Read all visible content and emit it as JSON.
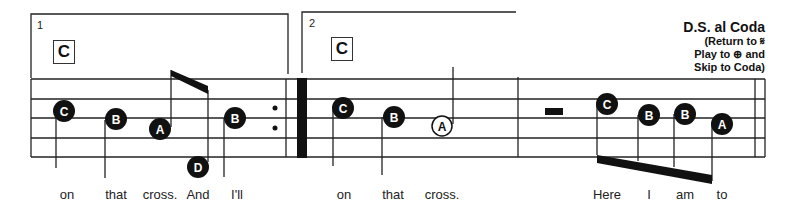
{
  "endings": [
    {
      "number": "1",
      "chord": "C"
    },
    {
      "number": "2",
      "chord": "C"
    }
  ],
  "direction": {
    "title": "D.S. al Coda",
    "line1": "(Return to 𝄋",
    "line2": "Play to ⊕ and",
    "line3": "Skip to Coda)"
  },
  "notes": [
    {
      "letter": "C",
      "x": 64,
      "y": 111,
      "filled": true,
      "stem": "down"
    },
    {
      "letter": "B",
      "x": 116,
      "y": 119,
      "filled": true,
      "stem": "down"
    },
    {
      "letter": "A",
      "x": 160,
      "y": 129,
      "filled": true,
      "stem": "up-beam"
    },
    {
      "letter": "D",
      "x": 198,
      "y": 167,
      "filled": true,
      "stem": "up-beam"
    },
    {
      "letter": "B",
      "x": 235,
      "y": 118,
      "filled": true,
      "stem": "down"
    },
    {
      "letter": "C",
      "x": 343,
      "y": 108,
      "filled": true,
      "stem": "down"
    },
    {
      "letter": "B",
      "x": 394,
      "y": 117,
      "filled": true,
      "stem": "down"
    },
    {
      "letter": "A",
      "x": 442,
      "y": 126,
      "filled": false,
      "stem": "up"
    },
    {
      "letter": "C",
      "x": 607,
      "y": 104,
      "filled": true,
      "stem": "down-beam"
    },
    {
      "letter": "B",
      "x": 649,
      "y": 115,
      "filled": true,
      "stem": "down-beam"
    },
    {
      "letter": "B",
      "x": 685,
      "y": 114,
      "filled": true,
      "stem": "down-beam"
    },
    {
      "letter": "A",
      "x": 722,
      "y": 124,
      "filled": true,
      "stem": "down-beam"
    }
  ],
  "lyrics": [
    {
      "text": "on",
      "x": 67
    },
    {
      "text": "that",
      "x": 116
    },
    {
      "text": "cross.",
      "x": 160
    },
    {
      "text": "And",
      "x": 198
    },
    {
      "text": "I'll",
      "x": 235
    },
    {
      "text": "on",
      "x": 344
    },
    {
      "text": "that",
      "x": 393
    },
    {
      "text": "cross.",
      "x": 442
    },
    {
      "text": "Here",
      "x": 607
    },
    {
      "text": "I",
      "x": 649
    },
    {
      "text": "am",
      "x": 685
    },
    {
      "text": "to",
      "x": 722
    }
  ]
}
